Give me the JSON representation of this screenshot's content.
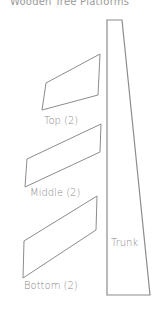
{
  "title": "Wooden Tree Platforms",
  "pieces": [
    {
      "id": "top",
      "label": "Top (2)",
      "points": "100,54 46,83 42,110 98,95"
    },
    {
      "id": "middle",
      "label": "Middle (2)",
      "points": "101,124 27,159 25,187 100,152"
    },
    {
      "id": "bottom",
      "label": "Bottom (2)",
      "points": "97,196 24,241 23,278 96,230"
    }
  ],
  "trunk": {
    "label": "Trunk",
    "points": "107,20 122,20 150,295 107,295"
  },
  "colors": {
    "stroke": "#8c8c8c",
    "text": "#8a8a8a"
  }
}
